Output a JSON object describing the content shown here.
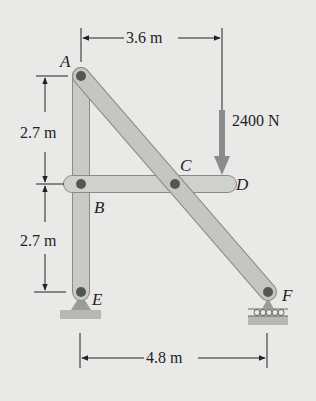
{
  "figure": {
    "type": "frame-statics-diagram",
    "points": {
      "A": "A",
      "B": "B",
      "C": "C",
      "D": "D",
      "E": "E",
      "F": "F"
    },
    "dimensions": {
      "top_horizontal": "3.6 m",
      "upper_vertical": "2.7 m",
      "lower_vertical": "2.7 m",
      "bottom_horizontal": "4.8 m"
    },
    "load": {
      "label": "2400 N",
      "direction": "down"
    },
    "members": [
      "AE",
      "AF",
      "BD"
    ],
    "supports": {
      "E": "pin",
      "F": "roller"
    },
    "colors": {
      "background": "#e9e9e7",
      "member_fill": "#c9c9c6",
      "member_edge": "#8a8a88",
      "load_arrow": "#8b8b8b",
      "ground": "#b7b7b4",
      "ink": "#222222"
    }
  }
}
